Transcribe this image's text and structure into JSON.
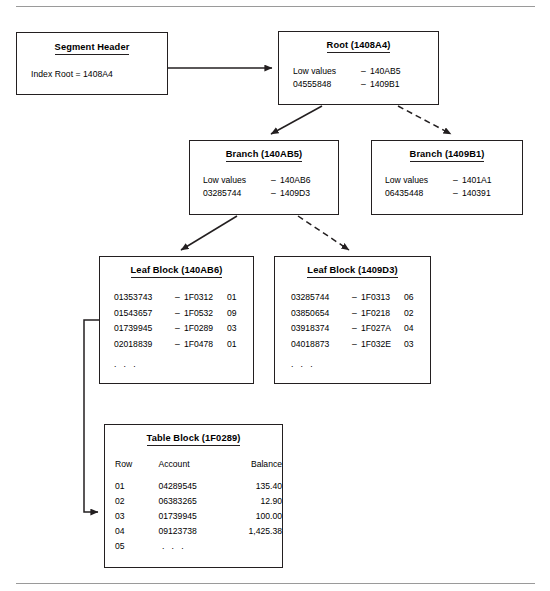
{
  "diagram": {
    "rules": {
      "top": "horizontal-rule",
      "bottom": "horizontal-rule"
    },
    "colors": {
      "line": "#231f20",
      "rule": "#9a9a9a",
      "background": "#ffffff"
    }
  },
  "segment_header": {
    "title": "Segment Header",
    "line": "Index Root = 1408A4"
  },
  "root": {
    "title": "Root (1408A4)",
    "entries": [
      {
        "key": "Low values",
        "dash": "–",
        "value": "140AB5"
      },
      {
        "key": "04555848",
        "dash": "–",
        "value": "1409B1"
      }
    ]
  },
  "branch_left": {
    "title": "Branch (140AB5)",
    "entries": [
      {
        "key": "Low values",
        "dash": "–",
        "value": "140AB6"
      },
      {
        "key": "03285744",
        "dash": "–",
        "value": "1409D3"
      }
    ]
  },
  "branch_right": {
    "title": "Branch (1409B1)",
    "entries": [
      {
        "key": "Low values",
        "dash": "–",
        "value": "1401A1"
      },
      {
        "key": "06435448",
        "dash": "–",
        "value": "140391"
      }
    ]
  },
  "leaf_left": {
    "title": "Leaf Block (140AB6)",
    "rows": [
      {
        "key": "01353743",
        "dash": "–",
        "pointer": "1F0312",
        "slot": "01"
      },
      {
        "key": "01543657",
        "dash": "–",
        "pointer": "1F0532",
        "slot": "09"
      },
      {
        "key": "01739945",
        "dash": "–",
        "pointer": "1F0289",
        "slot": "03"
      },
      {
        "key": "02018839",
        "dash": "–",
        "pointer": "1F0478",
        "slot": "01"
      }
    ],
    "ellipsis": ". . ."
  },
  "leaf_right": {
    "title": "Leaf Block (1409D3)",
    "rows": [
      {
        "key": "03285744",
        "dash": "–",
        "pointer": "1F0313",
        "slot": "06"
      },
      {
        "key": "03850654",
        "dash": "–",
        "pointer": "1F0218",
        "slot": "02"
      },
      {
        "key": "03918374",
        "dash": "–",
        "pointer": "1F027A",
        "slot": "04"
      },
      {
        "key": "04018873",
        "dash": "–",
        "pointer": "1F032E",
        "slot": "03"
      }
    ],
    "ellipsis": ". . ."
  },
  "table_block": {
    "title": "Table Block (1F0289)",
    "columns": [
      "Row",
      "Account",
      "Balance"
    ],
    "rows": [
      {
        "row": "01",
        "account": "04289545",
        "balance": "135.40"
      },
      {
        "row": "02",
        "account": "06383265",
        "balance": "12.90"
      },
      {
        "row": "03",
        "account": "01739945",
        "balance": "100.00"
      },
      {
        "row": "04",
        "account": "09123738",
        "balance": "1,425.38"
      }
    ],
    "last_row": {
      "row": "05",
      "account": ". . .",
      "balance": ""
    }
  },
  "connectors": [
    {
      "name": "segment-header-to-root",
      "style": "solid"
    },
    {
      "name": "root-to-branch-left",
      "style": "solid"
    },
    {
      "name": "root-to-branch-right",
      "style": "dashed"
    },
    {
      "name": "branch-left-to-leaf-left",
      "style": "solid"
    },
    {
      "name": "branch-left-to-leaf-right",
      "style": "dashed"
    },
    {
      "name": "leaf-left-to-table-block",
      "style": "solid"
    }
  ]
}
